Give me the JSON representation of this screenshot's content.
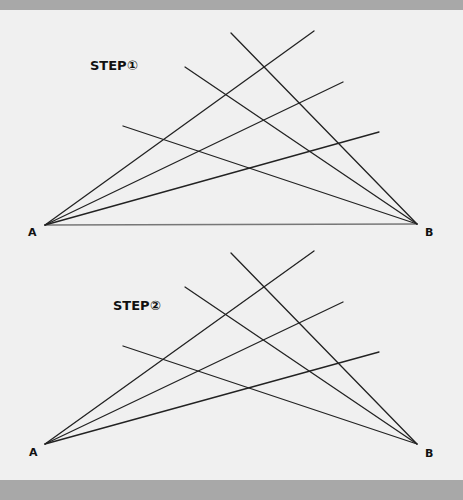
{
  "diagram": {
    "colors": {
      "background": "#f0f0f0",
      "bar": "#a8a8a8",
      "line": "#222222",
      "baseline": "#777777",
      "text": "#111111"
    },
    "figures": [
      {
        "title": "STEP①",
        "point_a": {
          "label": "A",
          "x": 45,
          "y": 225
        },
        "point_b": {
          "label": "B",
          "x": 417,
          "y": 224
        },
        "baseline_visible": true,
        "lines_to_a": [
          {
            "x": 314,
            "y": 31
          },
          {
            "x": 343,
            "y": 82
          },
          {
            "x": 379,
            "y": 132
          }
        ],
        "lines_to_b": [
          {
            "x": 231,
            "y": 33
          },
          {
            "x": 185,
            "y": 67
          },
          {
            "x": 123,
            "y": 126
          }
        ]
      },
      {
        "title": "STEP②",
        "point_a": {
          "label": "A",
          "x": 45,
          "y": 444
        },
        "point_b": {
          "label": "B",
          "x": 417,
          "y": 444
        },
        "baseline_visible": false,
        "lines_to_a": [
          {
            "x": 314,
            "y": 251
          },
          {
            "x": 343,
            "y": 302
          },
          {
            "x": 379,
            "y": 352
          }
        ],
        "lines_to_b": [
          {
            "x": 231,
            "y": 253
          },
          {
            "x": 185,
            "y": 287
          },
          {
            "x": 123,
            "y": 346
          }
        ]
      }
    ]
  }
}
